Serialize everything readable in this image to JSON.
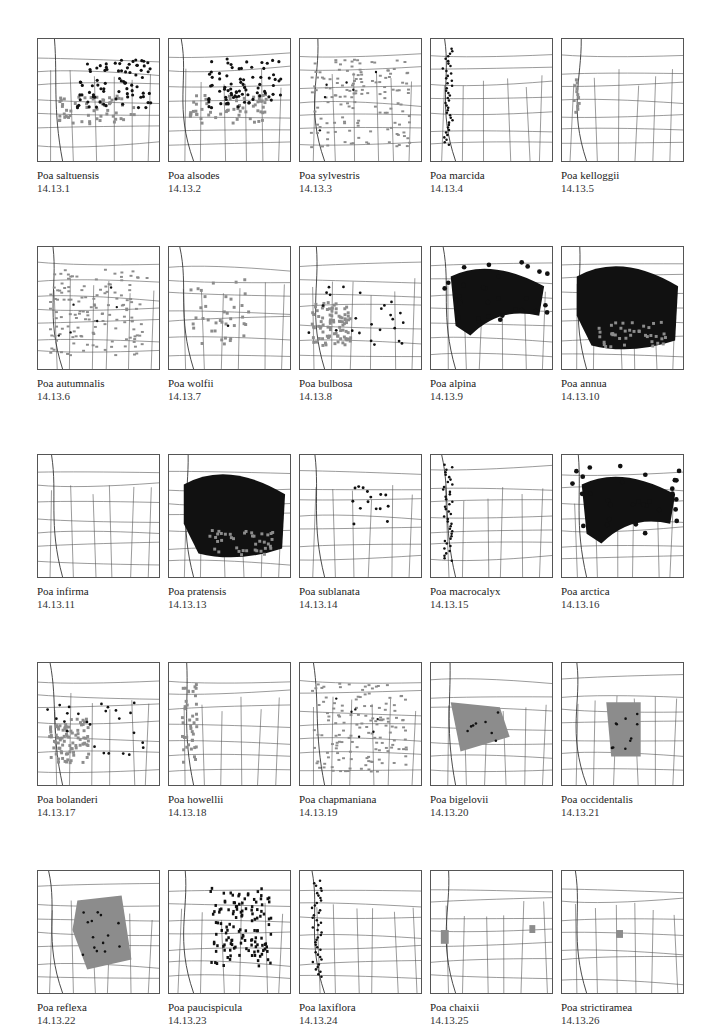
{
  "page": {
    "type": "distribution-map-plate",
    "legend_colors": {
      "dot": "#111111",
      "range": "#8c8c8c",
      "line": "#555555"
    }
  },
  "maps": [
    {
      "name": "Poa saltuensis",
      "number": "14.13.1",
      "region": "ne",
      "fill": "mixed"
    },
    {
      "name": "Poa alsodes",
      "number": "14.13.2",
      "region": "ne",
      "fill": "mixed"
    },
    {
      "name": "Poa sylvestris",
      "number": "14.13.3",
      "region": "east",
      "fill": "gray"
    },
    {
      "name": "Poa marcida",
      "number": "14.13.4",
      "region": "pnw",
      "fill": "coast"
    },
    {
      "name": "Poa kelloggii",
      "number": "14.13.5",
      "region": "pnw",
      "fill": "coast-small"
    },
    {
      "name": "Poa autumnalis",
      "number": "14.13.6",
      "region": "east",
      "fill": "gray"
    },
    {
      "name": "Poa wolfii",
      "number": "14.13.7",
      "region": "midwest",
      "fill": "gray-sparse"
    },
    {
      "name": "Poa bulbosa",
      "number": "14.13.8",
      "region": "na",
      "fill": "gray-west"
    },
    {
      "name": "Poa alpina",
      "number": "14.13.9",
      "region": "na",
      "fill": "black-north"
    },
    {
      "name": "Poa annua",
      "number": "14.13.10",
      "region": "na",
      "fill": "black-all"
    },
    {
      "name": "Poa infirma",
      "number": "14.13.11",
      "region": "na",
      "fill": "none"
    },
    {
      "name": "Poa pratensis",
      "number": "14.13.13",
      "region": "na",
      "fill": "black-all"
    },
    {
      "name": "Poa sublanata",
      "number": "14.13.14",
      "region": "alaska",
      "fill": "dots"
    },
    {
      "name": "Poa macrocalyx",
      "number": "14.13.15",
      "region": "alaska",
      "fill": "coast"
    },
    {
      "name": "Poa arctica",
      "number": "14.13.16",
      "region": "na",
      "fill": "black-north"
    },
    {
      "name": "Poa bolanderi",
      "number": "14.13.17",
      "region": "west",
      "fill": "gray-west"
    },
    {
      "name": "Poa howellii",
      "number": "14.13.18",
      "region": "west",
      "fill": "gray-coast"
    },
    {
      "name": "Poa chapmaniana",
      "number": "14.13.19",
      "region": "east",
      "fill": "gray"
    },
    {
      "name": "Poa bigelovii",
      "number": "14.13.20",
      "region": "sw",
      "fill": "gray-sw"
    },
    {
      "name": "Poa occidentalis",
      "number": "14.13.21",
      "region": "sw",
      "fill": "gray-nm"
    },
    {
      "name": "Poa reflexa",
      "number": "14.13.22",
      "region": "west",
      "fill": "gray-rockies"
    },
    {
      "name": "Poa paucispicula",
      "number": "14.13.23",
      "region": "nw",
      "fill": "black-coast"
    },
    {
      "name": "Poa laxiflora",
      "number": "14.13.24",
      "region": "nw",
      "fill": "coast"
    },
    {
      "name": "Poa chaixii",
      "number": "14.13.25",
      "region": "ne",
      "fill": "gray-small"
    },
    {
      "name": "Poa strictiramea",
      "number": "14.13.26",
      "region": "tx",
      "fill": "gray-tiny"
    }
  ]
}
